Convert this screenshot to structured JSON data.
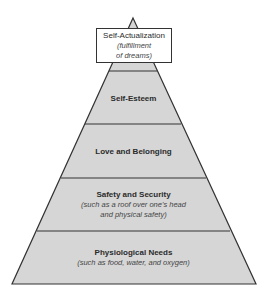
{
  "diagram": {
    "type": "pyramid",
    "colors": {
      "fill": "#d6d6d6",
      "stroke": "#333333",
      "box_fill": "#ffffff"
    },
    "top_box": {
      "title": "Self-Actualization",
      "subtitle_line1": "(fulfillment",
      "subtitle_line2": "of dreams)"
    },
    "levels": [
      {
        "title": "Self-Esteem"
      },
      {
        "title": "Love and Belonging"
      },
      {
        "title": "Safety and Security",
        "subtitle_line1": "(such as a roof over one's head",
        "subtitle_line2": "and physical safety)"
      },
      {
        "title": "Physiological Needs",
        "subtitle_line1": "(such as food, water, and oxygen)"
      }
    ]
  }
}
